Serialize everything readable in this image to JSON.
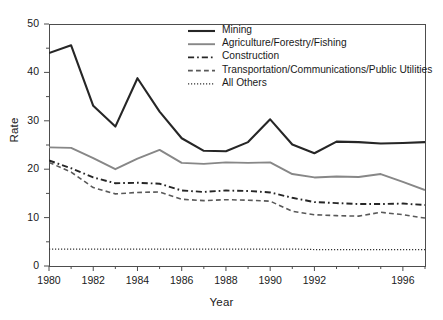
{
  "chart_data": {
    "type": "line",
    "title": "",
    "xlabel": "Year",
    "ylabel": "Rate",
    "xlim": [
      1980,
      1997
    ],
    "ylim": [
      0,
      50
    ],
    "grid": false,
    "legend_position": "top-right",
    "x": [
      1980,
      1981,
      1982,
      1983,
      1984,
      1985,
      1986,
      1987,
      1988,
      1989,
      1990,
      1991,
      1992,
      1993,
      1994,
      1995,
      1996,
      1997
    ],
    "xtick_labels": [
      "1980",
      "1982",
      "1984",
      "1986",
      "1988",
      "1990",
      "1992",
      "1996"
    ],
    "xtick_values": [
      1980,
      1982,
      1984,
      1986,
      1988,
      1990,
      1992,
      1996
    ],
    "ytick_labels": [
      "0",
      "10",
      "20",
      "30",
      "40",
      "50"
    ],
    "ytick_values": [
      0,
      10,
      20,
      30,
      40,
      50
    ],
    "yminor_values": [
      5,
      15,
      25,
      35,
      45
    ],
    "series": [
      {
        "name": "Mining",
        "style": "solid",
        "color": "#262626",
        "width": 2.1,
        "values": [
          44.0,
          45.6,
          33.1,
          28.8,
          38.8,
          31.9,
          26.4,
          23.8,
          23.7,
          25.6,
          30.3,
          25.1,
          23.3,
          25.7,
          25.6,
          25.3,
          25.4,
          25.6
        ]
      },
      {
        "name": "Agriculture/Forestry/Fishing",
        "style": "solid",
        "color": "#878787",
        "width": 1.9,
        "values": [
          24.5,
          24.4,
          22.3,
          20.0,
          22.2,
          24.0,
          21.3,
          21.1,
          21.4,
          21.3,
          21.4,
          19.0,
          18.3,
          18.5,
          18.4,
          19.0,
          17.4,
          15.7
        ]
      },
      {
        "name": "Construction",
        "style": "dashdot",
        "color": "#262626",
        "width": 1.9,
        "values": [
          21.8,
          20.2,
          18.3,
          17.1,
          17.2,
          17.0,
          15.6,
          15.3,
          15.6,
          15.5,
          15.2,
          14.1,
          13.2,
          13.0,
          12.8,
          12.8,
          12.9,
          12.6
        ]
      },
      {
        "name": "Transportation/Communications/Public Utilities",
        "style": "dashed",
        "color": "#595959",
        "width": 1.6,
        "values": [
          21.4,
          19.4,
          16.2,
          14.9,
          15.2,
          15.3,
          13.8,
          13.5,
          13.7,
          13.6,
          13.4,
          11.3,
          10.6,
          10.4,
          10.3,
          11.1,
          10.6,
          9.9
        ]
      },
      {
        "name": "All Others",
        "style": "dotted",
        "color": "#333333",
        "width": 1.2,
        "values": [
          3.5,
          3.5,
          3.5,
          3.5,
          3.5,
          3.5,
          3.5,
          3.5,
          3.5,
          3.5,
          3.5,
          3.5,
          3.4,
          3.4,
          3.4,
          3.4,
          3.4,
          3.4
        ]
      }
    ]
  },
  "plot_box": {
    "left": 49,
    "top": 24,
    "right": 425,
    "bottom": 266
  }
}
